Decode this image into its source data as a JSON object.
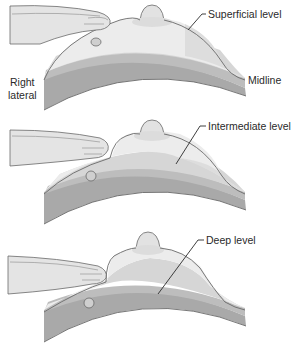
{
  "figure": {
    "colors": {
      "skin_light": "#ececec",
      "tissue_mid": "#d6d6d6",
      "tissue_deep": "#bdbdbd",
      "chest_wall": "#a9a9a9",
      "outline": "#6a6a6a",
      "hand": "#e4e4e4",
      "text": "#2a2a2a"
    },
    "panels": [
      {
        "id": "superficial",
        "level_label": "Superficial level",
        "side_labels": {
          "left_line1": "Right",
          "left_line2": "lateral",
          "right": "Midline"
        }
      },
      {
        "id": "intermediate",
        "level_label": "Intermediate level"
      },
      {
        "id": "deep",
        "level_label": "Deep level"
      }
    ]
  }
}
